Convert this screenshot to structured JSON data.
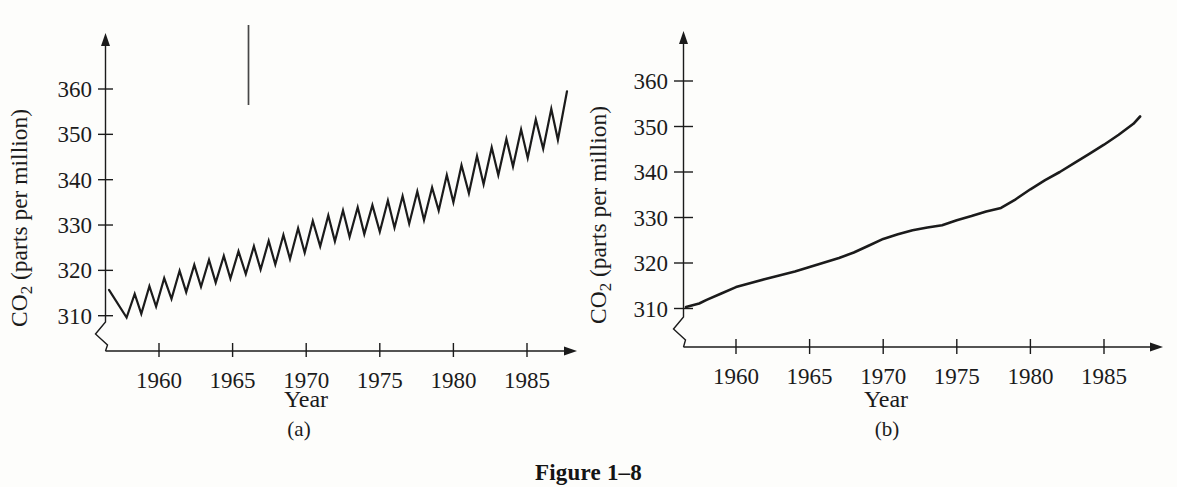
{
  "figure_caption": "Figure 1–8",
  "ink_color": "#1b1b1b",
  "paper_color": "#fdfdfb",
  "chart_data": [
    {
      "id": "a",
      "type": "line",
      "sublabel": "(a)",
      "xlabel": "Year",
      "ylabel": "CO2 (parts per million)",
      "ylabel_parts": [
        "CO",
        "2",
        " (parts per million)"
      ],
      "x_ticks": [
        "1960",
        "1965",
        "1970",
        "1975",
        "1980",
        "1985"
      ],
      "y_ticks": [
        "360",
        "350",
        "340",
        "330",
        "320",
        "310"
      ],
      "xlim": [
        1956.5,
        1988.8
      ],
      "ylim_shown": [
        310,
        360
      ],
      "y_axis_break": true,
      "points": [
        [
          1956.6,
          315.7
        ],
        [
          1957.8,
          309.6
        ],
        [
          1958.35,
          314.8
        ],
        [
          1958.8,
          310.4
        ],
        [
          1959.35,
          316.5
        ],
        [
          1959.8,
          312.0
        ],
        [
          1960.35,
          318.3
        ],
        [
          1960.85,
          313.7
        ],
        [
          1961.4,
          319.9
        ],
        [
          1961.85,
          315.2
        ],
        [
          1962.4,
          321.2
        ],
        [
          1962.85,
          316.4
        ],
        [
          1963.4,
          322.3
        ],
        [
          1963.85,
          317.3
        ],
        [
          1964.4,
          323.2
        ],
        [
          1964.85,
          318.2
        ],
        [
          1965.4,
          324.2
        ],
        [
          1965.9,
          319.2
        ],
        [
          1966.45,
          325.3
        ],
        [
          1966.9,
          320.2
        ],
        [
          1967.45,
          326.5
        ],
        [
          1967.9,
          321.3
        ],
        [
          1968.45,
          327.8
        ],
        [
          1968.9,
          322.5
        ],
        [
          1969.45,
          329.3
        ],
        [
          1969.9,
          323.9
        ],
        [
          1970.45,
          330.9
        ],
        [
          1970.95,
          325.3
        ],
        [
          1971.5,
          332.1
        ],
        [
          1971.95,
          326.4
        ],
        [
          1972.5,
          333.2
        ],
        [
          1972.95,
          327.4
        ],
        [
          1973.5,
          333.9
        ],
        [
          1973.95,
          328.0
        ],
        [
          1974.5,
          334.4
        ],
        [
          1975.0,
          328.5
        ],
        [
          1975.55,
          335.4
        ],
        [
          1976.0,
          329.4
        ],
        [
          1976.55,
          336.4
        ],
        [
          1977.0,
          330.3
        ],
        [
          1977.55,
          337.4
        ],
        [
          1978.0,
          331.1
        ],
        [
          1978.55,
          338.3
        ],
        [
          1979.0,
          333.2
        ],
        [
          1979.55,
          341.0
        ],
        [
          1980.0,
          335.0
        ],
        [
          1980.55,
          343.2
        ],
        [
          1981.05,
          337.0
        ],
        [
          1981.6,
          345.2
        ],
        [
          1982.05,
          339.0
        ],
        [
          1982.6,
          347.1
        ],
        [
          1983.05,
          341.0
        ],
        [
          1983.6,
          349.0
        ],
        [
          1984.05,
          342.9
        ],
        [
          1984.6,
          351.1
        ],
        [
          1985.05,
          344.8
        ],
        [
          1985.6,
          353.3
        ],
        [
          1986.1,
          346.8
        ],
        [
          1986.65,
          355.6
        ],
        [
          1987.1,
          348.8
        ],
        [
          1987.72,
          359.5
        ]
      ]
    },
    {
      "id": "b",
      "type": "line",
      "sublabel": "(b)",
      "xlabel": "Year",
      "ylabel": "CO2 (parts per million)",
      "ylabel_parts": [
        "CO",
        "2",
        " (parts per million)"
      ],
      "x_ticks": [
        "1960",
        "1965",
        "1970",
        "1975",
        "1980",
        "1985"
      ],
      "y_ticks": [
        "360",
        "350",
        "340",
        "330",
        "320",
        "310"
      ],
      "xlim": [
        1956.5,
        1988.8
      ],
      "ylim_shown": [
        310,
        360
      ],
      "y_axis_break": true,
      "points": [
        [
          1956.6,
          310.3
        ],
        [
          1957.5,
          311.1
        ],
        [
          1958,
          311.9
        ],
        [
          1959,
          313.3
        ],
        [
          1960,
          314.7
        ],
        [
          1961,
          315.6
        ],
        [
          1962,
          316.5
        ],
        [
          1963,
          317.3
        ],
        [
          1964,
          318.1
        ],
        [
          1965,
          319.1
        ],
        [
          1966,
          320.1
        ],
        [
          1967,
          321.1
        ],
        [
          1968,
          322.3
        ],
        [
          1969,
          323.8
        ],
        [
          1970,
          325.3
        ],
        [
          1971,
          326.3
        ],
        [
          1972,
          327.2
        ],
        [
          1973,
          327.8
        ],
        [
          1974,
          328.3
        ],
        [
          1975,
          329.4
        ],
        [
          1976,
          330.3
        ],
        [
          1977,
          331.3
        ],
        [
          1978,
          332.1
        ],
        [
          1979,
          334.0
        ],
        [
          1980,
          336.2
        ],
        [
          1981,
          338.2
        ],
        [
          1982,
          340.0
        ],
        [
          1983,
          342.0
        ],
        [
          1984,
          344.0
        ],
        [
          1985,
          346.0
        ],
        [
          1986,
          348.2
        ],
        [
          1987,
          350.6
        ],
        [
          1987.45,
          352.2
        ]
      ]
    }
  ]
}
